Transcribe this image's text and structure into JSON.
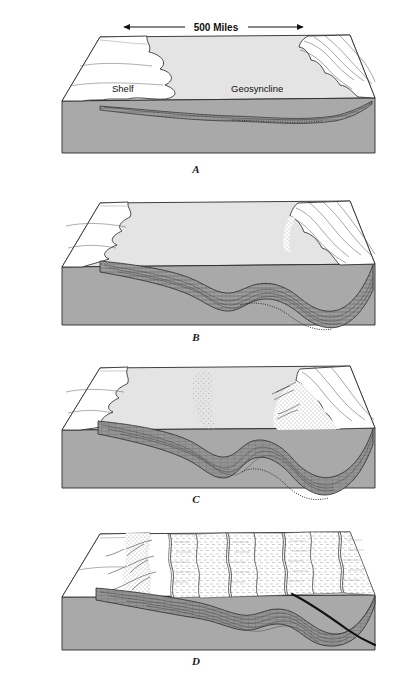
{
  "figure": {
    "title_visible": false,
    "background_color": "#ffffff",
    "scale_bar": {
      "label": "500 Miles",
      "left_arrow_icon": "arrow-left-icon",
      "right_arrow_icon": "arrow-right-icon"
    },
    "colors": {
      "block_side_gray": "#a9a9a9",
      "block_top_light": "#e4e4e4",
      "sediment_gray": "#8e8e8e",
      "outline": "#2b2b2b",
      "white_land": "#ffffff",
      "fault_line": "#1a1a1a",
      "stipple": "#9a9a9a"
    },
    "panels": [
      {
        "letter": "A",
        "labels": [
          {
            "text": "Shelf",
            "name": "shelf-label"
          },
          {
            "text": "Geosyncline",
            "name": "geosyncline-label"
          }
        ],
        "description_visible": false
      },
      {
        "letter": "B",
        "labels": [],
        "description_visible": false
      },
      {
        "letter": "C",
        "labels": [],
        "description_visible": false
      },
      {
        "letter": "D",
        "labels": [],
        "description_visible": false
      }
    ]
  }
}
